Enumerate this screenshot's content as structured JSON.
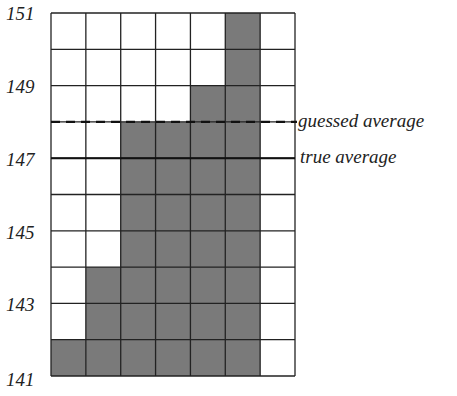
{
  "chart_data": {
    "type": "bar",
    "title": "",
    "xlabel": "",
    "ylabel": "",
    "ylim": [
      141,
      151
    ],
    "yticks": [
      141,
      143,
      145,
      147,
      149,
      151
    ],
    "grid": true,
    "categories": [
      "1",
      "2",
      "3",
      "4",
      "5",
      "6",
      "7"
    ],
    "values": [
      142,
      144,
      148,
      148,
      149,
      151,
      141
    ],
    "bar_color": "#7a7a7a",
    "annotations": [
      {
        "label": "guessed average",
        "y": 148,
        "style": "dashed"
      },
      {
        "label": "true average",
        "y": 147,
        "style": "solid"
      }
    ]
  },
  "labels": {
    "y141": "141",
    "y143": "143",
    "y145": "145",
    "y147": "147",
    "y149": "149",
    "y151": "151",
    "guessed": "guessed average",
    "true": "true average"
  }
}
